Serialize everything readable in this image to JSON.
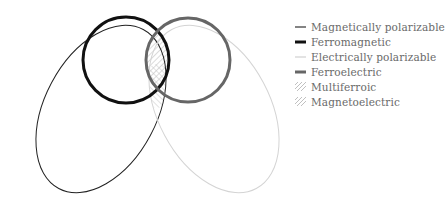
{
  "diagram": {
    "title": "",
    "shapes": [
      {
        "id": "magnetically-polarizable",
        "kind": "ellipse",
        "cx": 101,
        "cy": 109,
        "rx": 56,
        "ry": 90,
        "rotate": 28,
        "stroke": "#222222",
        "stroke_width": 1
      },
      {
        "id": "electrically-polarizable",
        "kind": "ellipse",
        "cx": 214,
        "cy": 109,
        "rx": 56,
        "ry": 90,
        "rotate": -28,
        "stroke": "#d4d4d4",
        "stroke_width": 1
      },
      {
        "id": "ferromagnetic",
        "kind": "circle",
        "cx": 126,
        "cy": 60,
        "r": 43,
        "stroke": "#111111",
        "stroke_width": 3
      },
      {
        "id": "ferroelectric",
        "kind": "circle",
        "cx": 188,
        "cy": 60,
        "r": 42,
        "stroke": "#666666",
        "stroke_width": 3
      }
    ],
    "hatch_colors": {
      "multiferroic": "#b8b8b8",
      "magnetoelectric": "#c4c4c4"
    }
  },
  "legend": {
    "items": [
      {
        "label": "Magnetically polarizable",
        "style": "thin-dark",
        "color": "#333333"
      },
      {
        "label": "Ferromagnetic",
        "style": "thick-black",
        "color": "#111111"
      },
      {
        "label": "Electrically polarizable",
        "style": "thin-light",
        "color": "#d0d0d0"
      },
      {
        "label": "Ferroelectric",
        "style": "thick-gray",
        "color": "#666666"
      },
      {
        "label": "Multiferroic",
        "style": "hatch",
        "color": "#c0c0c0"
      },
      {
        "label": "Magnetoelectric",
        "style": "hatch",
        "color": "#c0c0c0"
      }
    ]
  }
}
